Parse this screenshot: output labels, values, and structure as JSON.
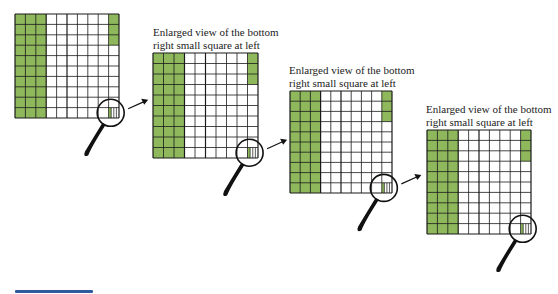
{
  "figure": {
    "colors": {
      "shaded": "#8fb85d",
      "grid_line": "#1a1a1a",
      "background": "#ffffff",
      "accent_bar": "#2f5a9e"
    },
    "grid": {
      "rows": 10,
      "cols": 10,
      "shaded_full_columns": 3,
      "last_column_shaded_cells_from_top": 3,
      "zoomed_cell_subdivisions": 4,
      "zoomed_cell_shaded_subdivisions": 1
    },
    "panels": [
      {
        "x": 15,
        "y": 14,
        "size": 104,
        "caption": null
      },
      {
        "x": 153,
        "y": 53,
        "size": 105,
        "caption": [
          "Enlarged view of the bottom",
          "right small square at left"
        ],
        "caption_x": 153,
        "caption_y": 27
      },
      {
        "x": 290,
        "y": 91,
        "size": 102,
        "caption": [
          "Enlarged view of the bottom",
          "right small square at left"
        ],
        "caption_x": 288,
        "caption_y": 65
      },
      {
        "x": 427,
        "y": 130,
        "size": 104,
        "caption": [
          "Enlarged view of the bottom",
          "right small square at left"
        ],
        "caption_x": 426,
        "caption_y": 104
      }
    ],
    "captions": {
      "panel2_line1": "Enlarged view of the bottom",
      "panel2_line2": "right small square at left",
      "panel3_line1": "Enlarged view of the bottom",
      "panel3_line2": "right small square at left",
      "panel4_line1": "Enlarged view of the bottom",
      "panel4_line2": "right small square at left"
    }
  }
}
